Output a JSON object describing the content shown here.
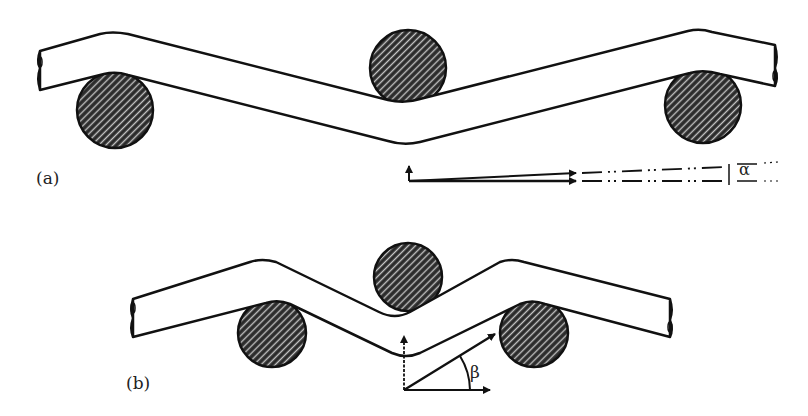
{
  "figure": {
    "panels": [
      {
        "id": "a",
        "label": "(a)",
        "angle_symbol": "α",
        "description": "Bar bent over three rollers with small deflection angle"
      },
      {
        "id": "b",
        "label": "(b)",
        "angle_symbol": "β",
        "description": "Bar bent over three closely spaced rollers with larger deflection angle"
      }
    ],
    "colors": {
      "stroke": "#111111",
      "roller_fill": "#2a2a2a",
      "hatch": "#bdbdbd",
      "background": "#ffffff"
    }
  }
}
